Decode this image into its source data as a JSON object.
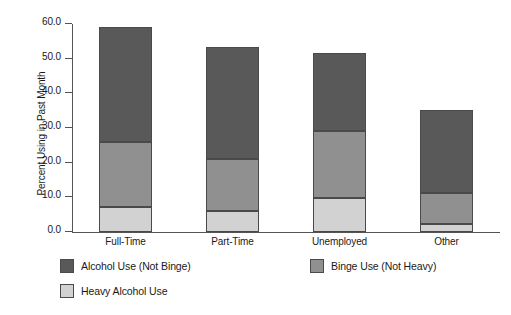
{
  "chart_data": {
    "type": "bar",
    "title": "",
    "xlabel": "",
    "ylabel": "Percent Using in Past Month",
    "categories": [
      "Full-Time",
      "Part-Time",
      "Unemployed",
      "Other"
    ],
    "stacked": true,
    "ylim": [
      0.0,
      60.0
    ],
    "yticks": [
      "0.0",
      "10.0",
      "20.0",
      "30.0",
      "40.0",
      "50.0",
      "60.0"
    ],
    "ytick_values": [
      0,
      10,
      20,
      30,
      40,
      50,
      60
    ],
    "grid": false,
    "legend_position": "below",
    "series": [
      {
        "name": "Heavy Alcohol Use",
        "color": "#d2d2d2",
        "values": [
          7.3,
          6.0,
          9.9,
          2.3
        ]
      },
      {
        "name": "Binge Use (Not Heavy)",
        "color": "#909090",
        "values": [
          18.8,
          15.0,
          19.2,
          8.9
        ]
      },
      {
        "name": "Alcohol Use (Not Binge)",
        "color": "#595959",
        "values": [
          32.9,
          32.4,
          22.4,
          23.9
        ]
      }
    ],
    "cumulative_tops": [
      [
        7.3,
        26.1,
        59.0
      ],
      [
        6.0,
        21.0,
        53.4
      ],
      [
        9.9,
        29.1,
        51.5
      ],
      [
        2.3,
        11.2,
        35.1
      ]
    ],
    "totals": [
      59.0,
      53.4,
      51.5,
      35.1
    ]
  },
  "legend": {
    "items": [
      {
        "label": "Alcohol Use (Not Binge)",
        "color": "#595959"
      },
      {
        "label": "Binge Use (Not Heavy)",
        "color": "#909090"
      },
      {
        "label": "Heavy Alcohol Use",
        "color": "#d2d2d2"
      }
    ]
  },
  "axis": {
    "y_title": "Percent Using in Past Month"
  }
}
